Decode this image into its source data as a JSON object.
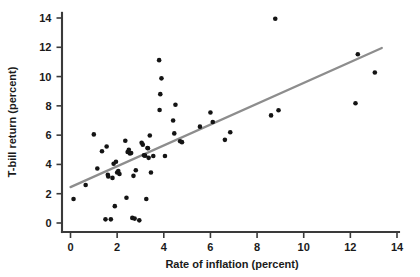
{
  "chart_data": {
    "type": "scatter",
    "title": "",
    "xlabel": "Rate of inflation (percent)",
    "ylabel": "T-bill return (percent)",
    "xlim": [
      -0.5,
      14.2
    ],
    "ylim": [
      -0.6,
      14.6
    ],
    "xticks": [
      0,
      2,
      4,
      6,
      8,
      10,
      12,
      14
    ],
    "xtick_labels": [
      "0",
      "2",
      "4",
      "6",
      "8",
      "10",
      "12",
      "14"
    ],
    "yticks": [
      0,
      2,
      4,
      6,
      8,
      10,
      12,
      14
    ],
    "ytick_labels": [
      "0",
      "2",
      "4",
      "6",
      "8",
      "10",
      "12",
      "14"
    ],
    "grid": false,
    "legend": null,
    "marker_color": "#141414",
    "trend_color": "#8d8d8d",
    "axis_color": "#3a3a3a",
    "points": [
      [
        0.13,
        1.64
      ],
      [
        0.65,
        2.6
      ],
      [
        1.0,
        6.05
      ],
      [
        1.15,
        3.72
      ],
      [
        1.35,
        4.9
      ],
      [
        1.5,
        0.25
      ],
      [
        1.55,
        5.22
      ],
      [
        1.6,
        3.3
      ],
      [
        1.62,
        3.18
      ],
      [
        1.73,
        0.25
      ],
      [
        1.8,
        3.08
      ],
      [
        1.85,
        4.05
      ],
      [
        1.9,
        1.15
      ],
      [
        1.95,
        4.18
      ],
      [
        2.0,
        3.45
      ],
      [
        2.05,
        3.55
      ],
      [
        2.1,
        3.35
      ],
      [
        2.35,
        5.62
      ],
      [
        2.4,
        1.72
      ],
      [
        2.45,
        4.85
      ],
      [
        2.5,
        5.0
      ],
      [
        2.55,
        4.75
      ],
      [
        2.6,
        4.78
      ],
      [
        2.65,
        0.35
      ],
      [
        2.7,
        3.22
      ],
      [
        2.75,
        0.3
      ],
      [
        2.8,
        3.6
      ],
      [
        2.95,
        0.18
      ],
      [
        3.05,
        5.48
      ],
      [
        3.1,
        5.35
      ],
      [
        3.15,
        4.62
      ],
      [
        3.2,
        4.6
      ],
      [
        3.25,
        1.64
      ],
      [
        3.3,
        5.12
      ],
      [
        3.32,
        5.1
      ],
      [
        3.35,
        4.45
      ],
      [
        3.4,
        5.98
      ],
      [
        3.45,
        3.45
      ],
      [
        3.55,
        4.58
      ],
      [
        3.8,
        11.12
      ],
      [
        3.82,
        7.72
      ],
      [
        3.85,
        8.8
      ],
      [
        3.9,
        9.88
      ],
      [
        4.05,
        4.58
      ],
      [
        4.4,
        7.0
      ],
      [
        4.45,
        6.12
      ],
      [
        4.5,
        8.08
      ],
      [
        4.7,
        5.58
      ],
      [
        4.78,
        5.52
      ],
      [
        5.55,
        6.58
      ],
      [
        6.0,
        7.55
      ],
      [
        6.1,
        6.9
      ],
      [
        6.62,
        5.68
      ],
      [
        6.85,
        6.2
      ],
      [
        8.6,
        7.35
      ],
      [
        8.78,
        13.95
      ],
      [
        8.92,
        7.7
      ],
      [
        12.22,
        8.18
      ],
      [
        12.32,
        11.52
      ],
      [
        13.05,
        10.28
      ]
    ],
    "trend": {
      "x_start": 0.0,
      "y_start": 2.45,
      "x_end": 13.35,
      "y_end": 11.95
    }
  }
}
